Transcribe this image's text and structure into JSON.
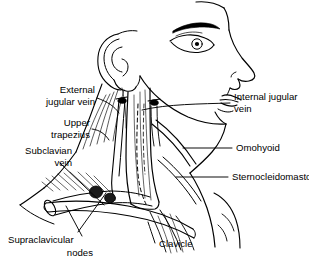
{
  "figure": {
    "type": "anatomical-line-drawing",
    "view": "right lateral profile of head, neck and shoulder",
    "background_color": "#ffffff",
    "ink_color": "#000000"
  },
  "labels": {
    "external_jugular_vein": {
      "line1": "External",
      "line2": "jugular vein",
      "align": "right",
      "side": "left"
    },
    "upper_trapezius": {
      "line1": "Upper",
      "line2": "trapezius",
      "align": "right",
      "side": "left"
    },
    "subclavian_vein": {
      "line1": "Subclavian",
      "line2": "vein",
      "align": "right",
      "side": "left"
    },
    "supraclavicular_nodes": {
      "line1": "Supraclavicular",
      "line2": "nodes",
      "align": "right",
      "side": "left"
    },
    "clavicle": {
      "line1": "Clavicle",
      "align": "left",
      "side": "bottom"
    },
    "internal_jugular_vein": {
      "line1": "Internal jugular",
      "line2": "vein",
      "align": "left",
      "side": "right"
    },
    "omohyoid": {
      "line1": "Omohyoid",
      "align": "left",
      "side": "right"
    },
    "sternocleidomastoid": {
      "line1": "Sternocleidomastoid",
      "align": "left",
      "side": "right"
    }
  },
  "structures": [
    "head-profile",
    "ear",
    "eye",
    "eyebrow",
    "nose",
    "lips",
    "chin",
    "mandible",
    "sternocleidomastoid-muscle",
    "trapezius-muscle",
    "omohyoid-muscle",
    "external-jugular-vein",
    "internal-jugular-vein",
    "subclavian-vein",
    "clavicle",
    "supraclavicular-lymph-nodes",
    "cut-vein-stump"
  ]
}
